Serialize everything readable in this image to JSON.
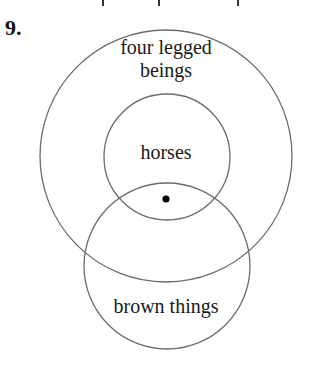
{
  "problem": {
    "number": "9."
  },
  "top_ticks": [
    {
      "x": 102
    },
    {
      "x": 158
    },
    {
      "x": 237
    }
  ],
  "diagram": {
    "type": "venn",
    "stroke_color": "#6b6b6b",
    "dot_color": "#000000",
    "sets": [
      {
        "id": "four-legged-beings",
        "label_line1": "four legged",
        "label_line2": "beings",
        "cx": 166,
        "cy": 156,
        "r": 126
      },
      {
        "id": "horses",
        "label": "horses",
        "cx": 167,
        "cy": 157,
        "r": 63
      },
      {
        "id": "brown-things",
        "label": "brown things",
        "cx": 167,
        "cy": 266,
        "r": 83
      }
    ],
    "point": {
      "cx": 166,
      "cy": 199,
      "r": 3.6,
      "region": "horses ∩ brown things ∩ four legged beings"
    }
  }
}
